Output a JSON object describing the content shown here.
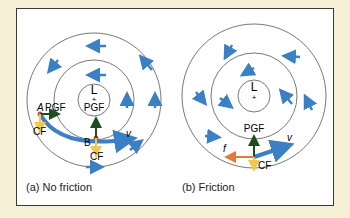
{
  "panels": [
    {
      "caption": "(a) No friction",
      "center_label": "L",
      "center_plus": "+",
      "labels": {
        "pgf_center": "PGF",
        "point_a": "A",
        "pgf_a": "PGF",
        "cf_a": "CF",
        "point_b": "B",
        "cf_b": "CF",
        "velocity": "v"
      }
    },
    {
      "caption": "(b) Friction",
      "center_label": "L",
      "center_plus": "+",
      "labels": {
        "pgf": "PGF",
        "friction": "f",
        "cf": "CF",
        "velocity": "v"
      }
    }
  ],
  "colors": {
    "background": "#f6f0d6",
    "frame": "#3a3a3a",
    "wind_arrow": "#3b7fc4",
    "pgf_arrow": "#1f4d1f",
    "cf_arrow": "#f2c94c",
    "friction_arrow": "#e07b3a",
    "point_marker": "#c0504d",
    "circle": "#555555"
  }
}
